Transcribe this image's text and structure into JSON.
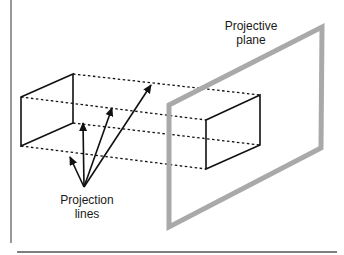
{
  "diagram": {
    "labels": {
      "plane_line1": "Projective",
      "plane_line2": "plane",
      "projection_line1": "Projection",
      "projection_line2": "lines"
    },
    "colors": {
      "ink": "#111111",
      "plane": "#a9a9a9",
      "frame": "#555555",
      "background": "#ffffff"
    },
    "frame": {
      "left_rule": {
        "x": 11,
        "y1": 0,
        "y2": 243
      },
      "bottom_rule": {
        "x1": 17,
        "x2": 337,
        "y": 252
      }
    },
    "source_rect": [
      [
        21,
        97
      ],
      [
        73,
        74
      ],
      [
        73,
        123
      ],
      [
        21,
        146
      ]
    ],
    "projected_rect": [
      [
        206,
        120
      ],
      [
        260,
        95
      ],
      [
        260,
        145
      ],
      [
        206,
        169
      ]
    ],
    "projective_plane": [
      [
        169,
        105
      ],
      [
        322,
        27
      ],
      [
        321,
        148
      ],
      [
        169,
        227
      ]
    ],
    "dashed_lines": [
      {
        "from": [
          73,
          74
        ],
        "to": [
          260,
          95
        ]
      },
      {
        "from": [
          21,
          97
        ],
        "to": [
          206,
          120
        ]
      },
      {
        "from": [
          73,
          123
        ],
        "to": [
          260,
          145
        ]
      },
      {
        "from": [
          21,
          146
        ],
        "to": [
          206,
          169
        ]
      }
    ],
    "arrows": {
      "origin": [
        84,
        187
      ],
      "tips": [
        [
          70,
          157
        ],
        [
          83,
          123
        ],
        [
          112,
          108
        ],
        [
          151,
          85
        ]
      ]
    }
  }
}
